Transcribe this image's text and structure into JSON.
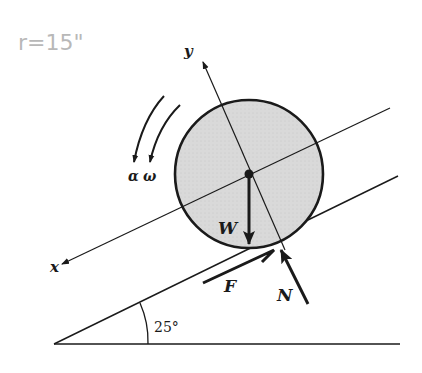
{
  "annotation": {
    "radius_note": "r=15\""
  },
  "labels": {
    "x_axis": "x",
    "y_axis": "y",
    "alpha": "α",
    "omega": "ω",
    "weight": "W",
    "friction": "F",
    "normal": "N",
    "incline_angle": "25°"
  },
  "colors": {
    "line": "#1a1a1a",
    "disk_fill": "#d9d9d9",
    "annotation": "#b8b8b8"
  }
}
